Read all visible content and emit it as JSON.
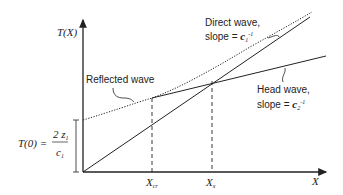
{
  "diagram": {
    "type": "travel-time curve (seismic refraction)",
    "axes": {
      "y_label": "T(X)",
      "x_label": "X"
    },
    "annotations": {
      "reflected_wave": "Reflected wave",
      "direct_wave_line1": "Direct wave,",
      "direct_wave_line2_prefix": "slope = ",
      "direct_wave_slope_var": "c",
      "direct_wave_slope_sub": "1",
      "direct_wave_slope_sup": "-1",
      "head_wave_line1": "Head wave,",
      "head_wave_line2_prefix": "slope = ",
      "head_wave_slope_var": "c",
      "head_wave_slope_sub": "2",
      "head_wave_slope_sup": "-1",
      "intercept_lhs": "T(0) = ",
      "intercept_num": "2 z",
      "intercept_num_sub": "1",
      "intercept_den": "c",
      "intercept_den_sub": "1"
    },
    "x_ticks": [
      {
        "label": "X",
        "sub": "cr"
      },
      {
        "label": "X",
        "sub": "x"
      }
    ],
    "curves": [
      {
        "name": "Reflected wave",
        "style": "dotted hyperbola"
      },
      {
        "name": "Direct wave",
        "style": "solid line through origin"
      },
      {
        "name": "Head wave",
        "style": "solid line, tangent to reflected wave at X_cr"
      }
    ],
    "colors": {
      "ink": "#222222",
      "background": "#ffffff"
    }
  }
}
